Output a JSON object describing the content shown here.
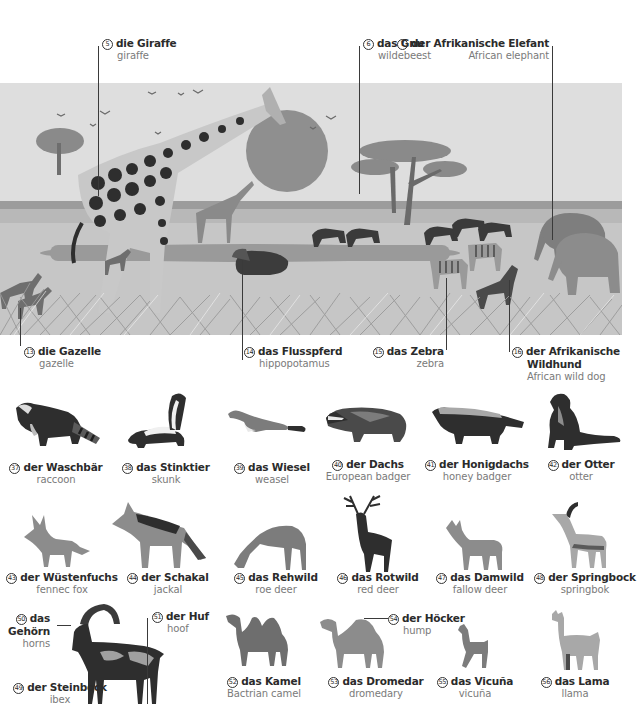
{
  "scene": {
    "title": "African savanna",
    "labels": [
      {
        "num": "5",
        "de": "die Giraffe",
        "en": "giraffe"
      },
      {
        "num": "6",
        "de": "das Gnu",
        "en": "wildebeest"
      },
      {
        "num": "7",
        "de": "der Afrikanische Elefant",
        "en": "African elephant"
      },
      {
        "num": "13",
        "de": "die Gazelle",
        "en": "gazelle"
      },
      {
        "num": "14",
        "de": "das Flusspferd",
        "en": "hippopotamus"
      },
      {
        "num": "15",
        "de": "das Zebra",
        "en": "zebra"
      },
      {
        "num": "16",
        "de": "der Afrikanische",
        "de2": "Wildhund",
        "en": "African wild dog"
      }
    ]
  },
  "animals": [
    {
      "num": "37",
      "de": "der Waschbär",
      "en": "raccoon"
    },
    {
      "num": "38",
      "de": "das Stinktier",
      "en": "skunk"
    },
    {
      "num": "39",
      "de": "das Wiesel",
      "en": "weasel"
    },
    {
      "num": "40",
      "de": "der Dachs",
      "en": "European badger"
    },
    {
      "num": "41",
      "de": "der Honigdachs",
      "en": "honey badger"
    },
    {
      "num": "42",
      "de": "der Otter",
      "en": "otter"
    },
    {
      "num": "43",
      "de": "der Wüstenfuchs",
      "en": "fennec fox"
    },
    {
      "num": "44",
      "de": "der Schakal",
      "en": "jackal"
    },
    {
      "num": "45",
      "de": "das Rehwild",
      "en": "roe deer"
    },
    {
      "num": "46",
      "de": "das Rotwild",
      "en": "red deer"
    },
    {
      "num": "47",
      "de": "das Damwild",
      "en": "fallow deer"
    },
    {
      "num": "48",
      "de": "der Springbock",
      "en": "springbok"
    },
    {
      "num": "49",
      "de": "der Steinbock",
      "en": "ibex"
    },
    {
      "num": "50",
      "de": "das",
      "de2": "Gehörn",
      "en": "horns"
    },
    {
      "num": "51",
      "de": "der Huf",
      "en": "hoof"
    },
    {
      "num": "52",
      "de": "das Kamel",
      "en": "Bactrian camel"
    },
    {
      "num": "53",
      "de": "das Dromedar",
      "en": "dromedary"
    },
    {
      "num": "54",
      "de": "der Höcker",
      "en": "hump"
    },
    {
      "num": "55",
      "de": "das Vicuña",
      "en": "vicuña"
    },
    {
      "num": "56",
      "de": "das Lama",
      "en": "llama"
    }
  ],
  "colors": {
    "sky": "#dcdcdc",
    "sun": "#8f8f8f",
    "ground": "#c4c4c4",
    "water": "#9a9a9a",
    "dark": "#2e2e2e",
    "mid": "#7c7c7c",
    "text_de": "#2b2b2b",
    "text_en": "#7a7a7a"
  }
}
